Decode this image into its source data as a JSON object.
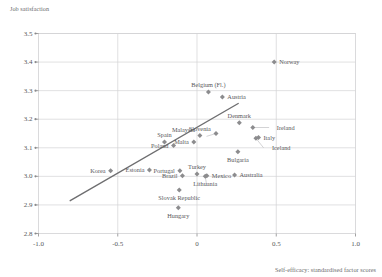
{
  "chart_data": {
    "type": "scatter",
    "title": "",
    "ylabel": "Job satisfaction",
    "xlabel": "Self-efficacy: standardised factor scores",
    "xlim": [
      -1.0,
      1.0
    ],
    "ylim": [
      2.8,
      3.5
    ],
    "xticks": [
      "-1.0",
      "-0.5",
      "0",
      "0.5",
      "1.0"
    ],
    "xtick_values": [
      -1.0,
      -0.5,
      0,
      0.5,
      1.0
    ],
    "yticks": [
      "3.5",
      "3.4",
      "3.3",
      "3.2",
      "3.1",
      "3.0",
      "2.9",
      "2.8"
    ],
    "ytick_values": [
      3.5,
      3.4,
      3.3,
      3.2,
      3.1,
      3.0,
      2.9,
      2.8
    ],
    "grid": "horizontal-and-vertical",
    "legend": "none",
    "marker": "diamond",
    "marker_color": "#8c8c8e",
    "trendline": {
      "label": "linear fit",
      "color": "#6e6e70",
      "x0": -0.8,
      "y0": 2.915,
      "x1": 0.26,
      "y1": 3.255
    },
    "points": [
      {
        "name": "Norway",
        "x": 0.487,
        "y": 3.4,
        "label_side": "right"
      },
      {
        "name": "Belgium (Fl.)",
        "x": 0.072,
        "y": 3.295,
        "label_side": "above"
      },
      {
        "name": "Austria",
        "x": 0.16,
        "y": 3.278,
        "label_side": "right"
      },
      {
        "name": "Denmark",
        "x": 0.267,
        "y": 3.188,
        "label_side": "above"
      },
      {
        "name": "Ireland",
        "x": 0.352,
        "y": 3.171,
        "label_side": "leader-right"
      },
      {
        "name": "Italy",
        "x": 0.388,
        "y": 3.136,
        "label_side": "right"
      },
      {
        "name": "Iceland",
        "x": 0.372,
        "y": 3.133,
        "label_side": "leader-below"
      },
      {
        "name": "Malaysia",
        "x": 0.12,
        "y": 3.15,
        "label_side": "leader-left"
      },
      {
        "name": "Slovenia",
        "x": 0.018,
        "y": 3.143,
        "label_side": "above"
      },
      {
        "name": "Malta",
        "x": -0.02,
        "y": 3.12,
        "label_side": "left"
      },
      {
        "name": "Spain",
        "x": -0.205,
        "y": 3.12,
        "label_side": "above"
      },
      {
        "name": "Poland",
        "x": -0.148,
        "y": 3.108,
        "label_side": "left"
      },
      {
        "name": "Bulgaria",
        "x": 0.258,
        "y": 3.086,
        "label_side": "below"
      },
      {
        "name": "Korea",
        "x": -0.545,
        "y": 3.02,
        "label_side": "left"
      },
      {
        "name": "Estonia",
        "x": -0.3,
        "y": 3.022,
        "label_side": "left"
      },
      {
        "name": "Portugal",
        "x": -0.108,
        "y": 3.02,
        "label_side": "left"
      },
      {
        "name": "Brazil",
        "x": -0.092,
        "y": 3.002,
        "label_side": "left"
      },
      {
        "name": "Turkey",
        "x": 0.0,
        "y": 3.008,
        "label_side": "above"
      },
      {
        "name": "Mexico",
        "x": 0.062,
        "y": 3.002,
        "label_side": "right"
      },
      {
        "name": "Lithuania",
        "x": 0.052,
        "y": 3.0,
        "label_side": "below"
      },
      {
        "name": "Australia",
        "x": 0.237,
        "y": 3.005,
        "label_side": "right"
      },
      {
        "name": "Slovak Republic",
        "x": -0.112,
        "y": 2.952,
        "label_side": "below"
      },
      {
        "name": "Hungary",
        "x": -0.118,
        "y": 2.89,
        "label_side": "below"
      }
    ]
  }
}
